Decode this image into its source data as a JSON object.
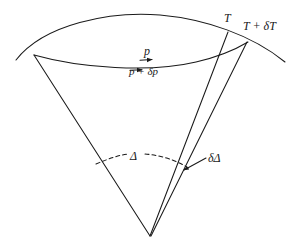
{
  "figure": {
    "background_color": "#ffffff",
    "line_color": "#1a1a1a",
    "labels": {
      "T": "T",
      "T_plus_dT": "T + δT",
      "p": "p",
      "p_plus_dp": "p + δp",
      "Delta": "Δ",
      "delta_Delta": "δΔ"
    },
    "elements": {
      "upper_wavefront_arc": "upper-arc",
      "lower_wavefront_arc": "lower-arc",
      "left_ray": "left-ray-line",
      "right_ray_T": "right-ray-line-T",
      "right_ray_TdT": "right-ray-line-T-delta-T",
      "angle_arc": "dashed-angle-arc",
      "arrow_p": "arrowhead-p",
      "arrow_pdp": "arrowhead-p-delta-p",
      "arrow_dDelta": "arrowhead-delta-delta",
      "leader_dDelta": "leader-line-delta-delta"
    }
  }
}
